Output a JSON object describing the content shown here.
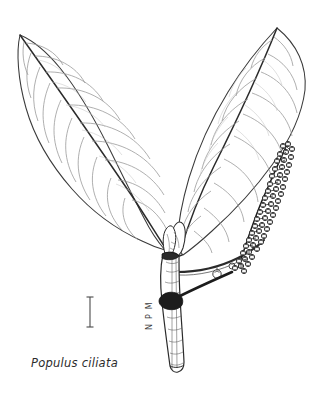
{
  "plate": {
    "width": 331,
    "height": 404,
    "background_color": "#ffffff",
    "ink_color": "#2b2b2b",
    "vein_color": "#8a8a8a",
    "catkin_color": "#1a1a1a",
    "medium": "pen-and-ink line drawing"
  },
  "caption": {
    "species_name": "Populus ciliata",
    "style": "italic"
  },
  "signature": {
    "initials": "N P M",
    "orientation": "vertical"
  },
  "scale_bar": {
    "label": "",
    "x": 90,
    "y_top": 297,
    "y_bottom": 327,
    "orientation": "vertical",
    "serif_width": 7
  },
  "subject": {
    "common_description": "Himalayan poplar shoot with two leaves and a fruiting catkin",
    "parts": [
      {
        "name": "left-leaf",
        "label": "Leaf (left)",
        "shape": "ovate-acuminate",
        "apex_point": [
          20,
          35
        ],
        "secondary_vein_pairs": 9
      },
      {
        "name": "right-leaf",
        "label": "Leaf (right)",
        "shape": "broadly ovate-acuminate",
        "apex_point": [
          277,
          28
        ],
        "secondary_vein_pairs": 10
      },
      {
        "name": "catkin",
        "label": "Fruiting catkin",
        "capsule_count": 54,
        "top_point": [
          288,
          142
        ],
        "bottom_point": [
          243,
          250
        ]
      },
      {
        "name": "terminal-bud",
        "label": "Terminal bud"
      },
      {
        "name": "woody-stem",
        "label": "Woody stem",
        "top_point": [
          168,
          250
        ],
        "bottom_point": [
          176,
          372
        ]
      },
      {
        "name": "lateral-capsule",
        "label": "Detached capsule"
      }
    ]
  }
}
